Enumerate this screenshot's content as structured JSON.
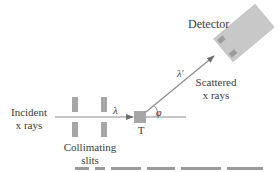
{
  "diagram": {
    "labels": {
      "detector": "Detector",
      "incident_line1": "Incident",
      "incident_line2": "x rays",
      "collimating_line1": "Collimating",
      "collimating_line2": "slits",
      "scattered_line1": "Scattered",
      "scattered_line2": "x rays",
      "target": "T",
      "incident_wavelength": "λ",
      "scattered_wavelength": "λ′",
      "scattering_angle": "φ"
    },
    "colors": {
      "line": "#8a8a8a",
      "component_fill": "#a6a6a6",
      "detector_fill": "#c8c8c8",
      "detector_patch": "#9c9c9c",
      "text": "#3a3a3a"
    },
    "caption_fragment": ""
  }
}
